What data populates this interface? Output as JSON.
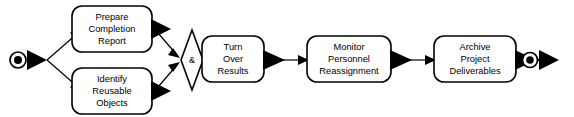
{
  "diagram": {
    "type": "activity-diagram",
    "colors": {
      "background": "#ffffff",
      "stroke": "#000000",
      "fill": "#ffffff",
      "text": "#000000"
    },
    "start_node": {
      "name": "start-node",
      "shape": "filled-circle-in-circle"
    },
    "end_node": {
      "name": "end-node",
      "shape": "filled-circle-in-circle"
    },
    "gateway": {
      "name": "and-join-gateway",
      "symbol": "&",
      "shape": "diamond",
      "kind": "and-join"
    },
    "activities": [
      {
        "id": "prepare-completion-report",
        "lines": [
          "Prepare",
          "Completion",
          "Report"
        ]
      },
      {
        "id": "identify-reusable-objects",
        "lines": [
          "Identify",
          "Reusable",
          "Objects"
        ]
      },
      {
        "id": "turn-over-results",
        "lines": [
          "Turn",
          "Over",
          "Results"
        ]
      },
      {
        "id": "monitor-personnel-reassignment",
        "lines": [
          "Monitor",
          "Personnel",
          "Reassignment"
        ]
      },
      {
        "id": "archive-project-deliverables",
        "lines": [
          "Archive",
          "Project",
          "Deliverables"
        ]
      }
    ],
    "flows": [
      {
        "id": "flow-start-to-prepare",
        "from": "start-node",
        "to": "prepare-completion-report"
      },
      {
        "id": "flow-start-to-identify",
        "from": "start-node",
        "to": "identify-reusable-objects"
      },
      {
        "id": "flow-prepare-to-gateway",
        "from": "prepare-completion-report",
        "to": "and-join-gateway"
      },
      {
        "id": "flow-identify-to-gateway",
        "from": "identify-reusable-objects",
        "to": "and-join-gateway"
      },
      {
        "id": "flow-gateway-to-turnover",
        "from": "and-join-gateway",
        "to": "turn-over-results"
      },
      {
        "id": "flow-turnover-to-monitor",
        "from": "turn-over-results",
        "to": "monitor-personnel-reassignment"
      },
      {
        "id": "flow-monitor-to-archive",
        "from": "monitor-personnel-reassignment",
        "to": "archive-project-deliverables"
      },
      {
        "id": "flow-archive-to-end",
        "from": "archive-project-deliverables",
        "to": "end-node"
      }
    ]
  }
}
